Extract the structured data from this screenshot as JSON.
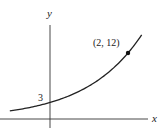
{
  "chart_data": {
    "type": "line",
    "title": "",
    "xlabel": "x",
    "ylabel": "y",
    "function": "y = 3 * 2^x",
    "series": [
      {
        "name": "exponential curve",
        "x": [
          -1,
          -0.5,
          0,
          0.5,
          1,
          1.5,
          2,
          2.3
        ],
        "values": [
          1.5,
          2.12,
          3,
          4.24,
          6,
          8.49,
          12,
          14.77
        ]
      }
    ],
    "annotations": [
      {
        "label": "3",
        "x": 0,
        "y": 3,
        "kind": "y-intercept"
      },
      {
        "label": "(2, 12)",
        "x": 2,
        "y": 12,
        "kind": "point"
      }
    ],
    "grid": false,
    "legend": null,
    "color": "#222222"
  },
  "labels": {
    "x_axis": "x",
    "y_axis": "y",
    "intercept": "3",
    "point": "(2, 12)"
  }
}
